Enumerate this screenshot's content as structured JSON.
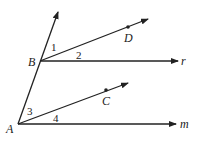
{
  "diagram": {
    "points": {
      "A": {
        "label": "A"
      },
      "B": {
        "label": "B"
      },
      "C": {
        "label": "C"
      },
      "D": {
        "label": "D"
      }
    },
    "rays": {
      "r": {
        "label": "r"
      },
      "m": {
        "label": "m"
      }
    },
    "angles": [
      "1",
      "2",
      "3",
      "4"
    ],
    "colors": {
      "line": "#222222",
      "background": "#ffffff"
    }
  }
}
